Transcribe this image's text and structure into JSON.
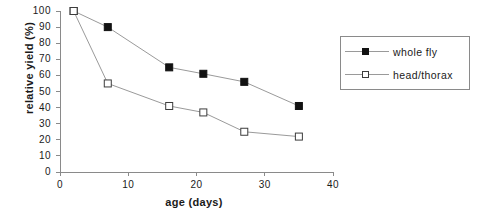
{
  "chart_data": {
    "type": "line",
    "title": "",
    "xlabel": "age  (days)",
    "ylabel": "relative  yield  (%)",
    "xlim": [
      0,
      40
    ],
    "ylim": [
      0,
      100
    ],
    "xticks": [
      0,
      10,
      20,
      30,
      40
    ],
    "yticks": [
      0,
      10,
      20,
      30,
      40,
      50,
      60,
      70,
      80,
      90,
      100
    ],
    "xtick_labels": [
      "0",
      "10",
      "20",
      "30",
      "40"
    ],
    "ytick_labels": [
      "0",
      "10",
      "20",
      "30",
      "40",
      "50",
      "60",
      "70",
      "80",
      "90",
      "100"
    ],
    "grid": false,
    "legend_position": "right",
    "series": [
      {
        "name": "whole fly",
        "marker": "filled-square",
        "color": "#121212",
        "x": [
          2,
          7,
          16,
          21,
          27,
          35
        ],
        "values": [
          100,
          90,
          65,
          61,
          56,
          41
        ]
      },
      {
        "name": "head/thorax",
        "marker": "open-square",
        "color": "#ffffff",
        "x": [
          2,
          7,
          16,
          21,
          27,
          35
        ],
        "values": [
          100,
          55,
          41,
          37,
          25,
          22
        ]
      }
    ]
  },
  "legend": {
    "entries": [
      {
        "label": "whole  fly"
      },
      {
        "label": "head/thorax"
      }
    ]
  },
  "colors": {
    "axis": "#8a8a8a",
    "line": "#9a9a9a",
    "marker_filled": "#121212",
    "marker_open_border": "#3c3c3c",
    "text": "#1a1a1a"
  }
}
